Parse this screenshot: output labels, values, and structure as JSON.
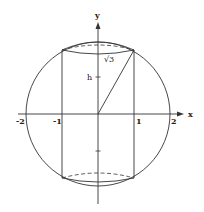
{
  "figure": {
    "axes": {
      "x_label": "x",
      "y_label": "y",
      "x_ticks": [
        "-2",
        "-1",
        "1",
        "2"
      ]
    },
    "labels": {
      "height": "h",
      "sqrt3": "√3"
    },
    "colors": {
      "stroke": "#333333",
      "background": "#ffffff"
    }
  }
}
